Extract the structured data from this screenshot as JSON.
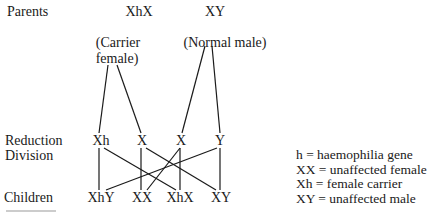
{
  "diagram": {
    "type": "inheritance-cross",
    "row_labels": {
      "parents": "Parents",
      "reduction_line1": "Reduction",
      "reduction_line2": "Division",
      "children": "Children"
    },
    "parents": {
      "mother": {
        "genotype": "XhX",
        "label_line1": "(Carrier",
        "label_line2": "female)"
      },
      "father": {
        "genotype": "XY",
        "label": "(Normal male)"
      }
    },
    "gametes": [
      "Xh",
      "X",
      "X",
      "Y"
    ],
    "children": [
      "XhY",
      "XX",
      "XhX",
      "XY"
    ],
    "crosses": [
      {
        "from": "Xh",
        "to": "XhY"
      },
      {
        "from": "Xh",
        "to": "XhX"
      },
      {
        "from": "X (mother)",
        "to": "XX"
      },
      {
        "from": "X (mother)",
        "to": "XY"
      },
      {
        "from": "X (father)",
        "to": "XX"
      },
      {
        "from": "X (father)",
        "to": "XhX"
      },
      {
        "from": "Y",
        "to": "XhY"
      },
      {
        "from": "Y",
        "to": "XY"
      }
    ],
    "legend": [
      "h = haemophilia gene",
      "XX = unaffected female",
      "Xh = female carrier",
      "XY = unaffected male"
    ],
    "line_color": "#1a1a1a"
  }
}
